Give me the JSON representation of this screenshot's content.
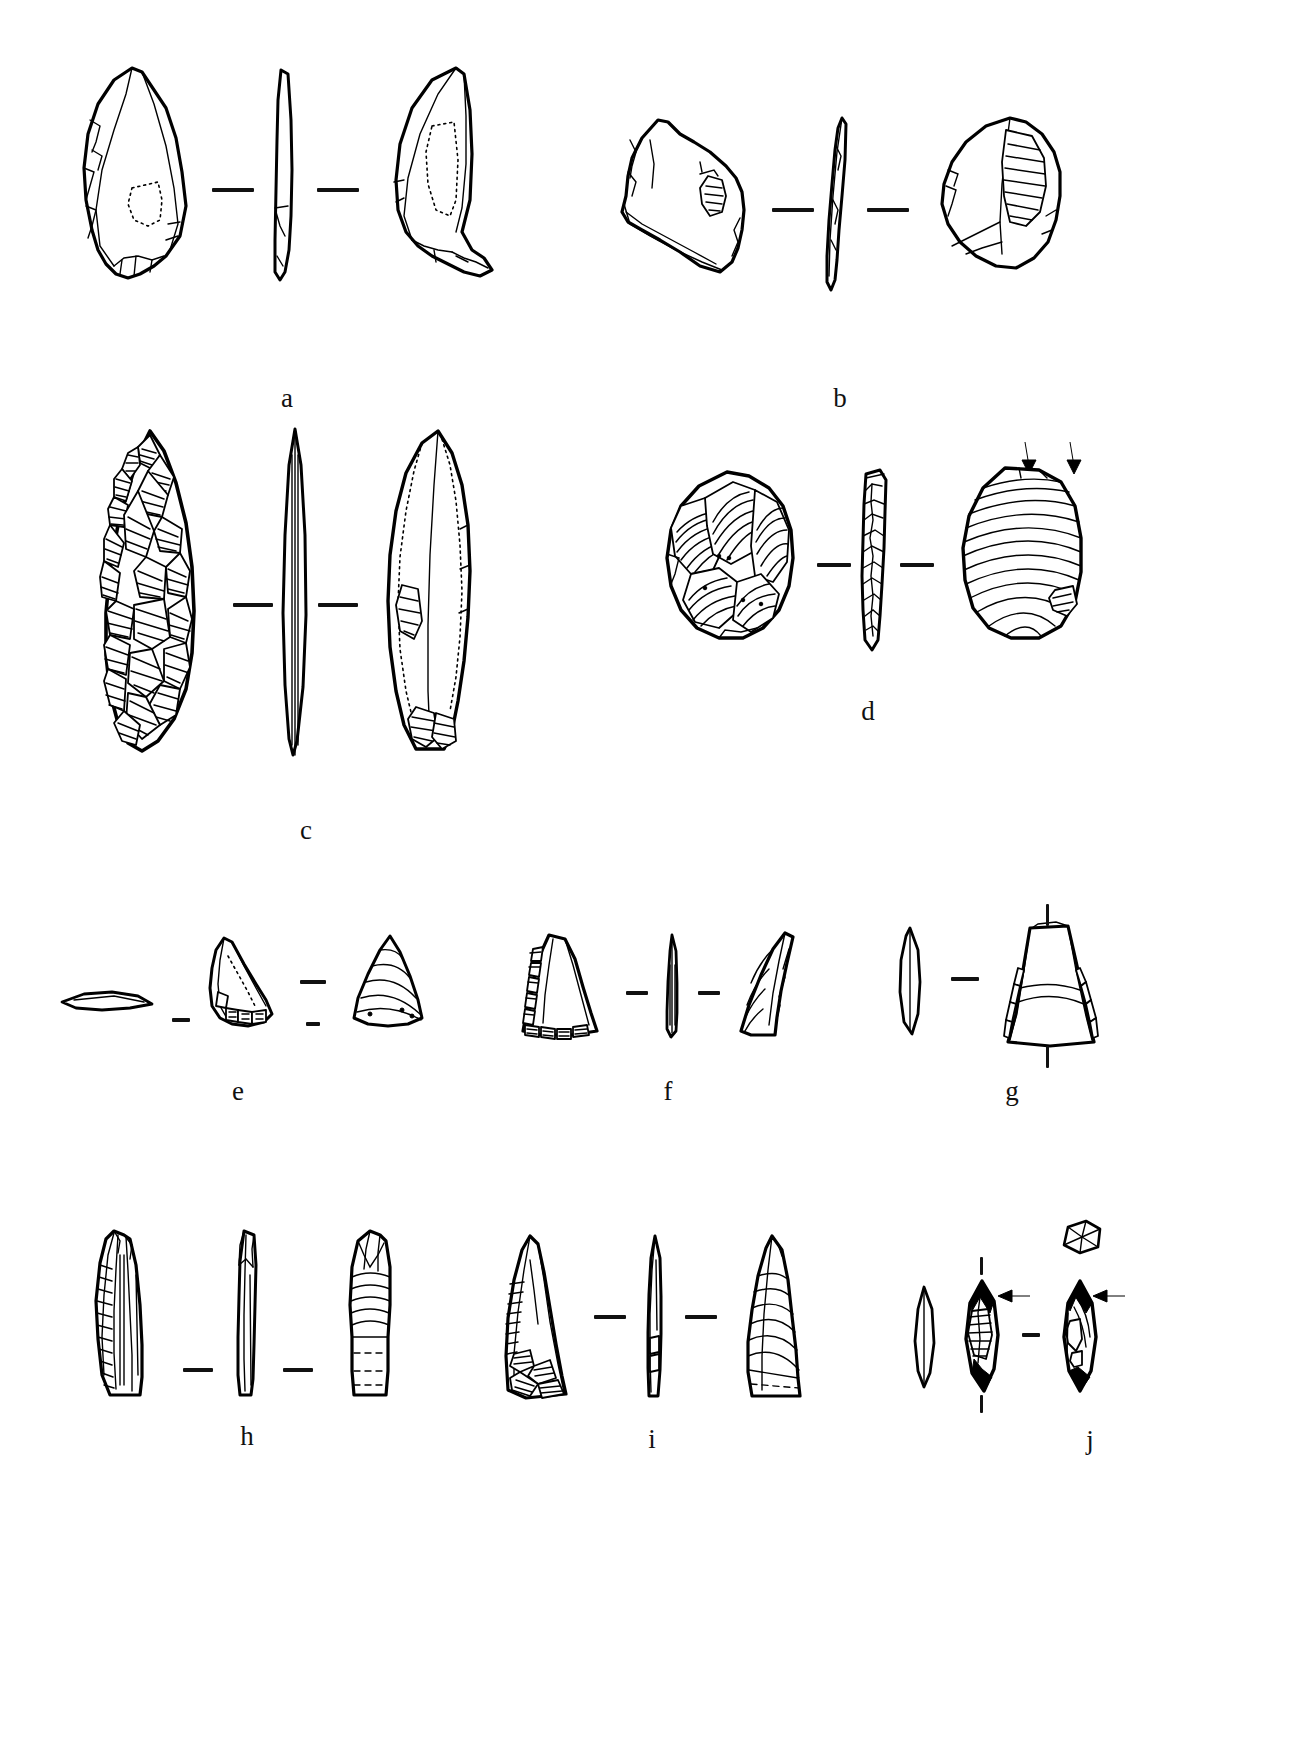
{
  "plate": {
    "title": "Lithic artifact illustration plate",
    "background_color": "#ffffff",
    "ink_color": "#000000",
    "width_px": 1296,
    "height_px": 1757,
    "separator_glyph": "—",
    "figure_type": "archaeological-line-drawing"
  },
  "specimens": [
    {
      "id": "a",
      "label": "a",
      "label_x": 287,
      "label_y": 352,
      "row": 1,
      "description": "Bifacially retouched pointed flake / leaf-shaped point",
      "views": [
        "dorsal",
        "profile",
        "ventral"
      ],
      "view_count": 3,
      "separator_marks": 2,
      "separator_orientation": "horizontal",
      "has_arrows": false
    },
    {
      "id": "b",
      "label": "b",
      "label_x": 840,
      "label_y": 352,
      "row": 1,
      "description": "Levallois-like flake with faceted platform and bulbar scar",
      "views": [
        "dorsal",
        "profile",
        "ventral"
      ],
      "view_count": 3,
      "separator_marks": 2,
      "separator_orientation": "horizontal",
      "has_arrows": false
    },
    {
      "id": "c",
      "label": "c",
      "label_x": 306,
      "label_y": 830,
      "row": 2,
      "description": "Fully bifacial laurel-leaf point with invasive flake scars",
      "views": [
        "dorsal",
        "profile",
        "ventral"
      ],
      "view_count": 3,
      "separator_marks": 2,
      "separator_orientation": "horizontal",
      "has_arrows": false
    },
    {
      "id": "d",
      "label": "d",
      "label_x": 868,
      "label_y": 723,
      "row": 2,
      "description": "Discoidal core / thick flake, ventral face with concentric ripples",
      "views": [
        "dorsal",
        "profile",
        "ventral"
      ],
      "view_count": 3,
      "separator_marks": 2,
      "separator_orientation": "horizontal",
      "has_arrows": true,
      "arrow_count": 2,
      "arrow_direction": "down",
      "arrow_meaning": "percussion / impact point indicator"
    },
    {
      "id": "e",
      "label": "e",
      "label_x": 222,
      "label_y": 1098,
      "row": 3,
      "description": "Small triangular point, four views including basal section",
      "views": [
        "section",
        "dorsal",
        "ventral"
      ],
      "view_count": 3,
      "separator_marks": 3,
      "separator_orientation": "horizontal",
      "has_arrows": false
    },
    {
      "id": "f",
      "label": "f",
      "label_x": 667,
      "label_y": 1098,
      "row": 3,
      "description": "Triangular retouched point with marginal denticulation",
      "views": [
        "dorsal",
        "profile",
        "ventral"
      ],
      "view_count": 3,
      "separator_marks": 2,
      "separator_orientation": "horizontal",
      "has_arrows": false
    },
    {
      "id": "g",
      "label": "g",
      "label_x": 1012,
      "label_y": 1098,
      "row": 3,
      "description": "Trapezoidal / truncated flake, profile plus face view",
      "views": [
        "profile",
        "face"
      ],
      "view_count": 2,
      "separator_marks": 3,
      "separator_orientation": "mixed",
      "has_arrows": false
    },
    {
      "id": "h",
      "label": "h",
      "label_x": 247,
      "label_y": 1462,
      "row": 4,
      "description": "Elongated blade-like point, three views",
      "views": [
        "dorsal",
        "profile",
        "ventral"
      ],
      "view_count": 3,
      "separator_marks": 2,
      "separator_orientation": "horizontal",
      "has_arrows": false
    },
    {
      "id": "i",
      "label": "i",
      "label_x": 652,
      "label_y": 1462,
      "row": 4,
      "description": "Retouched convergent point, three views",
      "views": [
        "dorsal",
        "profile",
        "ventral"
      ],
      "view_count": 3,
      "separator_marks": 2,
      "separator_orientation": "horizontal",
      "has_arrows": false
    },
    {
      "id": "j",
      "label": "j",
      "label_x": 1090,
      "label_y": 1462,
      "row": 4,
      "description": "Small backed bladelet / microlith with cross-section inset",
      "views": [
        "section",
        "dorsal",
        "ventral",
        "cross-section-inset"
      ],
      "view_count": 4,
      "separator_marks": 3,
      "separator_orientation": "mixed",
      "has_arrows": true,
      "arrow_count": 2,
      "arrow_direction": "left",
      "arrow_meaning": "retouch / impact feature indicator"
    }
  ],
  "rows": [
    {
      "index": 1,
      "specimen_ids": [
        "a",
        "b"
      ],
      "top_y": 60
    },
    {
      "index": 2,
      "specimen_ids": [
        "c",
        "d"
      ],
      "top_y": 420
    },
    {
      "index": 3,
      "specimen_ids": [
        "e",
        "f",
        "g"
      ],
      "top_y": 900
    },
    {
      "index": 4,
      "specimen_ids": [
        "h",
        "i",
        "j"
      ],
      "top_y": 1215
    }
  ]
}
